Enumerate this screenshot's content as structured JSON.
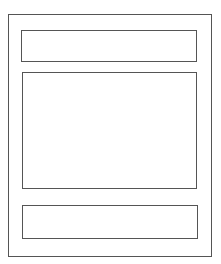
{
  "wireframe": {
    "stroke_color": "#555555",
    "background_color": "#ffffff",
    "regions": [
      {
        "id": "outer",
        "role": "page-frame"
      },
      {
        "id": "header",
        "role": "header-block"
      },
      {
        "id": "main",
        "role": "content-block"
      },
      {
        "id": "footer",
        "role": "footer-block"
      }
    ]
  }
}
